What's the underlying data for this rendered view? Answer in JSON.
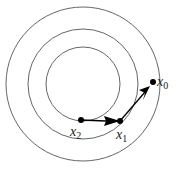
{
  "diagram": {
    "title": "",
    "contours": [
      {
        "name": "outer-contour"
      },
      {
        "name": "middle-contour"
      },
      {
        "name": "inner-contour"
      }
    ],
    "points": [
      {
        "id": "x0",
        "label": "x",
        "subscript": "0"
      },
      {
        "id": "x1",
        "label": "x",
        "subscript": "1"
      },
      {
        "id": "x2",
        "label": "x",
        "subscript": "2"
      }
    ],
    "steps": [
      {
        "from": "x0",
        "to": "x1",
        "arrow_direction": "toward x0"
      },
      {
        "from": "x2",
        "to": "x1",
        "arrow_direction": "toward x1"
      }
    ],
    "colors": {
      "contour": "#555555",
      "arrow": "#000000",
      "point": "#000000"
    }
  }
}
